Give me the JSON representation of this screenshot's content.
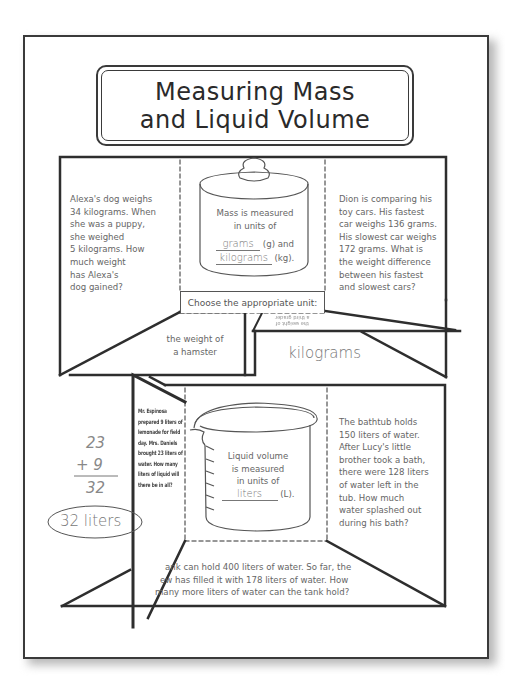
{
  "title": {
    "line1": "Measuring Mass",
    "line2": "and Liquid Volume"
  },
  "mass_section": {
    "left_problem": [
      "Alexa's dog weighs",
      "34 kilograms. When",
      "she was a puppy,",
      "she weighed",
      "5 kilograms. How",
      "much weight",
      "has Alexa's",
      "dog gained?"
    ],
    "center": {
      "line1": "Mass is measured",
      "line2": "in units of",
      "answer1": "grams",
      "unit1": "(g) and",
      "answer2": "kilograms",
      "unit2": "(kg)."
    },
    "right_problem": [
      "Dion is comparing his",
      "toy cars. His fastest",
      "car weighs 136 grams.",
      "His slowest car weighs",
      "172 grams. What is",
      "the weight difference",
      "between his fastest",
      "and slowest cars?"
    ],
    "choose_label": "Choose the appropriate unit:",
    "flap_left": [
      "the weight of",
      "a hamster"
    ],
    "flap_tiny": [
      "the weight of",
      "a third grader"
    ],
    "answer_kilograms": "kilograms",
    "icon": "weight-icon"
  },
  "volume_section": {
    "left_flap_problem": [
      "Mr. Espinosa",
      "prepared 9 liters of",
      "lemonade for field",
      "day. Mrs. Daniels",
      "brought 23 liters of",
      "water. How many",
      "liters of liquid will",
      "there be in all?"
    ],
    "work": {
      "addend1": "23",
      "addend2": "+ 9",
      "sum": "32",
      "answer": "32 liters"
    },
    "center": {
      "line1": "Liquid volume",
      "line2": "is measured",
      "line3": "in units of",
      "answer": "liters",
      "unit": "(L)."
    },
    "right_problem": [
      "The bathtub holds",
      "150 liters of water.",
      "After Lucy's little",
      "brother took a bath,",
      "there were 128 liters",
      "of water left in the",
      "tub. How much",
      "water splashed out",
      "during his bath?"
    ],
    "bottom_problem": [
      "ank can hold 400 liters of water. So far, the",
      "ew has filled it with 178 liters of water. How",
      "many more liters of water can the tank hold?"
    ],
    "icon": "beaker-icon"
  },
  "colors": {
    "line": "#2e2e2e",
    "text": "#5a5a5a",
    "shadow": "#b8b8b8"
  }
}
